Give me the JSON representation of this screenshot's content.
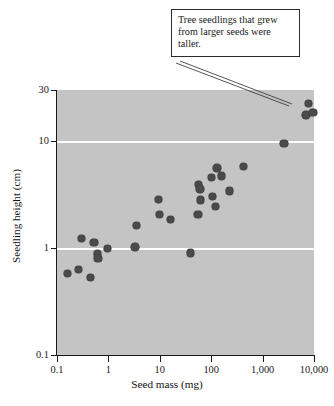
{
  "figure": {
    "callout_text": "Tree seedlings that grew from larger seeds were taller.",
    "background_color": "#c4c4c4",
    "marker_color": "#4a4a4a",
    "gridline_color": "#ffffff"
  },
  "chart_data": {
    "type": "scatter",
    "title": "",
    "xlabel": "Seed mass (mg)",
    "ylabel": "Seedling height (cm)",
    "xscale": "log",
    "yscale": "log",
    "xlim": [
      0.1,
      10000
    ],
    "ylim": [
      0.1,
      30
    ],
    "xticks": [
      0.1,
      1,
      10,
      100,
      1000,
      10000
    ],
    "xtick_labels": [
      "0.1",
      "1",
      "10",
      "100",
      "1,000",
      "10,000"
    ],
    "yticks": [
      0.1,
      1,
      10,
      30
    ],
    "ytick_labels": [
      "0.1",
      "1",
      "10",
      "30"
    ],
    "gridlines_y": [
      1,
      10
    ],
    "grid": "horizontal-white-at-1-and-10",
    "legend": "none",
    "annotations": [
      {
        "text": "Tree seedlings that grew from larger seeds were taller.",
        "points_to_x": 7000,
        "points_to_y": 19
      }
    ],
    "series": [
      {
        "name": "Tree seedlings",
        "points": [
          {
            "x": 0.16,
            "y": 0.58
          },
          {
            "x": 0.26,
            "y": 0.63
          },
          {
            "x": 0.3,
            "y": 1.22
          },
          {
            "x": 0.45,
            "y": 0.53
          },
          {
            "x": 0.52,
            "y": 1.13
          },
          {
            "x": 0.62,
            "y": 0.88
          },
          {
            "x": 0.63,
            "y": 0.8
          },
          {
            "x": 0.95,
            "y": 0.99
          },
          {
            "x": 3.3,
            "y": 1.02
          },
          {
            "x": 3.5,
            "y": 1.62
          },
          {
            "x": 9.5,
            "y": 2.85
          },
          {
            "x": 9.8,
            "y": 2.05
          },
          {
            "x": 16.0,
            "y": 1.85
          },
          {
            "x": 40.0,
            "y": 0.9
          },
          {
            "x": 55.0,
            "y": 2.05
          },
          {
            "x": 57.0,
            "y": 3.9
          },
          {
            "x": 60.0,
            "y": 3.55
          },
          {
            "x": 62.0,
            "y": 2.8
          },
          {
            "x": 100.0,
            "y": 4.55
          },
          {
            "x": 105.0,
            "y": 3.05
          },
          {
            "x": 120.0,
            "y": 2.45
          },
          {
            "x": 130.0,
            "y": 5.6
          },
          {
            "x": 160.0,
            "y": 4.7
          },
          {
            "x": 225.0,
            "y": 3.4
          },
          {
            "x": 430.0,
            "y": 5.8
          },
          {
            "x": 2600.0,
            "y": 9.5
          },
          {
            "x": 7000.0,
            "y": 17.5
          },
          {
            "x": 7800.0,
            "y": 22.5
          },
          {
            "x": 9600.0,
            "y": 18.5
          }
        ]
      }
    ]
  }
}
